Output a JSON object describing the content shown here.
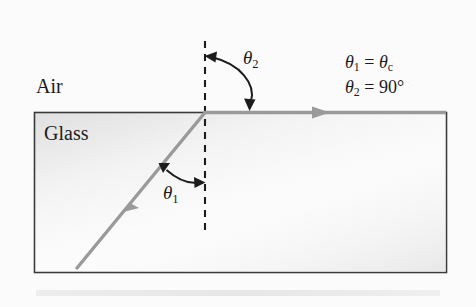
{
  "figure": {
    "background_color": "#fbfbfb",
    "regions": {
      "air": {
        "label": "Air",
        "position": "above the glass block"
      },
      "glass": {
        "label": "Glass",
        "position": "inside the rectangular block",
        "border_color": "#3a3a3a",
        "fill_light": "#ffffff",
        "fill_shadow": "#e2e2e2"
      }
    },
    "rays": {
      "color": "#9a9a9a",
      "incident": {
        "name": "incident ray",
        "direction": "up and to the right, from lower-left toward the interface"
      },
      "refracted": {
        "name": "refracted ray",
        "direction": "to the right, grazing along the interface"
      }
    },
    "normal": {
      "name": "normal line",
      "style": "dashed",
      "color": "#1c1c1c"
    },
    "angles": [
      {
        "id": "theta1",
        "symbol": "θ",
        "subscript": "1",
        "description": "angle of incidence between incident ray and normal, inside the glass"
      },
      {
        "id": "theta2",
        "symbol": "θ",
        "subscript": "2",
        "description": "angle of refraction between normal and refracted ray, in the air"
      }
    ],
    "equations": [
      {
        "id": "equation-1",
        "lhs_symbol": "θ",
        "lhs_subscript": "1",
        "operator": "=",
        "rhs_symbol": "θ",
        "rhs_subscript": "c",
        "text": "θ1 = θc"
      },
      {
        "id": "equation-2",
        "lhs_symbol": "θ",
        "lhs_subscript": "2",
        "operator": "=",
        "rhs_value": "90°",
        "text": "θ2 = 90°"
      }
    ]
  }
}
